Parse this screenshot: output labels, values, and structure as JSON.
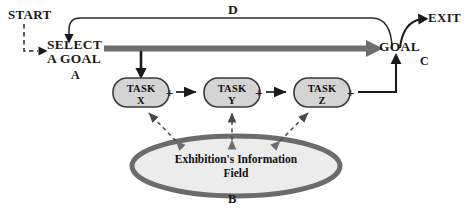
{
  "diagram": {
    "title_nodes": {
      "start": "START",
      "select_goal_line1": "SELECT",
      "select_goal_line2": "A GOAL",
      "goal": "GOAL",
      "exit": "EXIT"
    },
    "labels": {
      "a": "A",
      "b": "B",
      "c": "C",
      "d": "D"
    },
    "tasks": [
      {
        "line1": "TASK",
        "line2": "X"
      },
      {
        "line1": "TASK",
        "line2": "Y"
      },
      {
        "line1": "TASK",
        "line2": "Z"
      }
    ],
    "operators": [
      "+",
      "+",
      "+"
    ],
    "field": {
      "line1": "Exhibition's Information",
      "line2": "Field"
    },
    "colors": {
      "ink": "#1a1a1a",
      "thick_bar": "#6e6e6e",
      "node_fill": "#d4d4d4",
      "node_stroke": "#3a3a3a",
      "ellipse_stroke": "#6b6b6b",
      "ellipse_fill": "#ececec",
      "background": "#ffffff"
    }
  }
}
